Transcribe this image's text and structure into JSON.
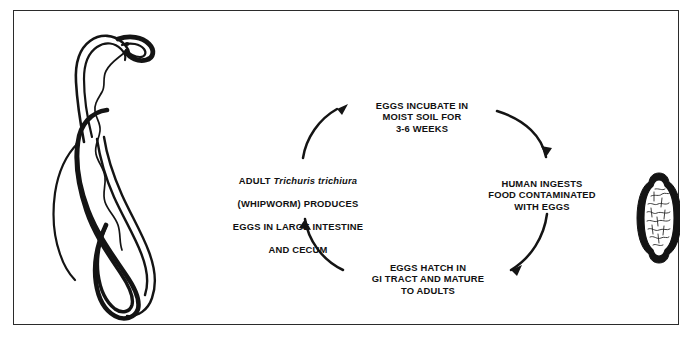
{
  "figure": {
    "background_color": "#ffffff",
    "ink_color": "#111111",
    "border_color": "#2b2b2b"
  },
  "illustrations": {
    "worm": {
      "name": "adult-whipworm-illustration",
      "caption_in_image": ""
    },
    "egg": {
      "name": "trichuris-egg-illustration",
      "caption_in_image": ""
    }
  },
  "cycle": {
    "direction": "clockwise",
    "arrow_count": 4,
    "stages": [
      {
        "id": "incubate",
        "position": "top",
        "lines": [
          "EGGS INCUBATE IN",
          "MOIST SOIL FOR",
          "3-6 WEEKS"
        ],
        "text": "EGGS INCUBATE IN\nMOIST SOIL FOR\n3-6 WEEKS"
      },
      {
        "id": "ingests",
        "position": "right",
        "lines": [
          "HUMAN INGESTS",
          "FOOD CONTAMINATED",
          "WITH EGGS"
        ],
        "text": "HUMAN INGESTS\nFOOD CONTAMINATED\nWITH EGGS"
      },
      {
        "id": "hatch",
        "position": "bottom",
        "lines": [
          "EGGS HATCH IN",
          "GI TRACT AND MATURE",
          "TO ADULTS"
        ],
        "text": "EGGS HATCH IN\nGI TRACT AND MATURE\nTO ADULTS"
      },
      {
        "id": "adult",
        "position": "left",
        "lines": [
          "ADULT Trichuris trichiura",
          "(WHIPWORM) PRODUCES",
          "EGGS IN LARGE INTESTINE",
          "AND CECUM"
        ],
        "line1_prefix": "ADULT ",
        "line1_species_italic": "Trichuris trichiura",
        "line2": "(WHIPWORM) PRODUCES",
        "line3": "EGGS IN LARGE INTESTINE",
        "line4": "AND CECUM"
      }
    ]
  }
}
